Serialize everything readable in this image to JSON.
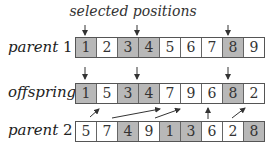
{
  "title": "selected positions",
  "rows": {
    "parent1": {
      "label": "parent",
      "label_num": "1",
      "cells": [
        "1",
        "2",
        "3",
        "4",
        "5",
        "6",
        "7",
        "8",
        "9"
      ],
      "selected": [
        0,
        2,
        3,
        7
      ]
    },
    "offspring": {
      "label": "offspring",
      "cells": [
        "1",
        "5",
        "3",
        "4",
        "7",
        "9",
        "6",
        "8",
        "2"
      ],
      "selected": [
        0,
        2,
        3,
        7
      ]
    },
    "parent2": {
      "label": "parent",
      "label_num": "2",
      "cells": [
        "5",
        "7",
        "4",
        "9",
        "1",
        "3",
        "6",
        "2",
        "8"
      ],
      "selected": [
        2,
        4,
        5,
        8
      ]
    }
  },
  "colors": {
    "selected_fill": "#b8b8b8",
    "cell_fill": "#ffffff",
    "stroke": "#555555"
  }
}
